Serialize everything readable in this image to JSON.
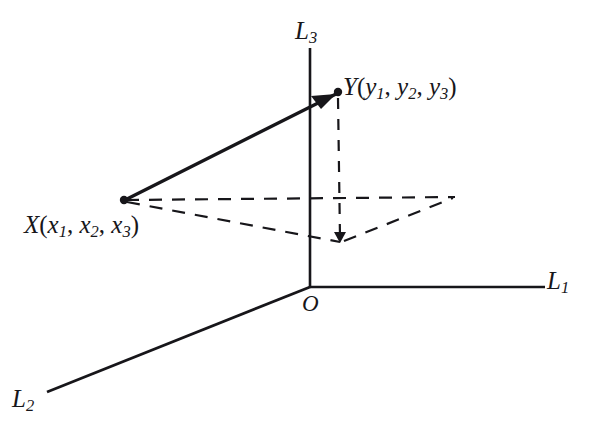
{
  "figure": {
    "type": "3d-coordinate-diagram",
    "background_color": "#ffffff",
    "ink_color": "#17161a",
    "axes": [
      {
        "id": "L1",
        "label": "L",
        "subscript": "1",
        "description": "horizontal axis to the right"
      },
      {
        "id": "L2",
        "label": "L",
        "subscript": "2",
        "description": "oblique axis to the lower left"
      },
      {
        "id": "L3",
        "label": "L",
        "subscript": "3",
        "description": "vertical axis upward"
      }
    ],
    "origin": {
      "label": "O"
    },
    "points": [
      {
        "id": "X",
        "name": "X",
        "open_paren": "(",
        "close_paren": ")",
        "coords": [
          {
            "base": "x",
            "sub": "1"
          },
          {
            "base": "x",
            "sub": "2"
          },
          {
            "base": "x",
            "sub": "3"
          }
        ],
        "separator": ", ",
        "full_label": "X(x1, x2, x3)"
      },
      {
        "id": "Y",
        "name": "Y",
        "open_paren": "(",
        "close_paren": ")",
        "coords": [
          {
            "base": "y",
            "sub": "1"
          },
          {
            "base": "y",
            "sub": "2"
          },
          {
            "base": "y",
            "sub": "3"
          }
        ],
        "separator": ", ",
        "full_label": "Y(y1, y2, y3)"
      }
    ],
    "vector": {
      "from": "X",
      "to": "Y",
      "style": "solid",
      "arrowhead": true
    },
    "construction_lines": {
      "style": "dashed",
      "description": "projection parallelogram and vertical drop from Y"
    }
  },
  "labels": {
    "l1": {
      "base": "L",
      "sub": "1"
    },
    "l2": {
      "base": "L",
      "sub": "2"
    },
    "l3": {
      "base": "L",
      "sub": "3"
    },
    "origin": "O",
    "x_point": {
      "name": "X",
      "lp": "(",
      "c1": "x",
      "s1": "1",
      "sep1": ", ",
      "c2": "x",
      "s2": "2",
      "sep2": ", ",
      "c3": "x",
      "s3": "3",
      "rp": ")"
    },
    "y_point": {
      "name": "Y",
      "lp": "(",
      "c1": "y",
      "s1": "1",
      "sep1": ", ",
      "c2": "y",
      "s2": "2",
      "sep2": ", ",
      "c3": "y",
      "s3": "3",
      "rp": ")"
    }
  }
}
